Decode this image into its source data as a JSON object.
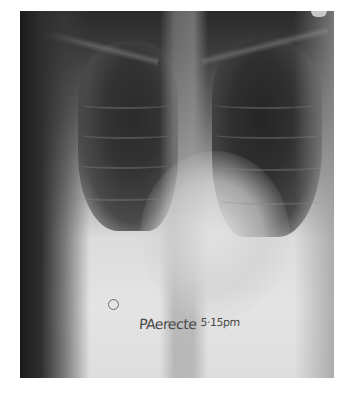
{
  "image": {
    "subject": "chest-xray",
    "view": "PA erect",
    "annotation_text": "PAerecte",
    "annotation_time": "5·15pm",
    "marker": "R-side marker circle",
    "colors": {
      "background": "#ffffff",
      "lung_dark": "#2b2b2b",
      "bone_light": "#dcdcdc",
      "ink": "#4a4a4a"
    }
  }
}
